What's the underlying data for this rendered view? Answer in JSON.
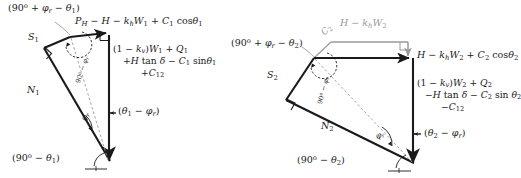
{
  "figure": {
    "type": "force-polygon-diagram",
    "colors": {
      "stroke": "#1a1a1a",
      "dashed": "#9a9a9a",
      "gray_construction": "#9a9a9a",
      "background": "#ffffff"
    }
  },
  "left_polygon": {
    "name": "polygon-1",
    "angle_top_left": "(90° + ϕr − θ1)",
    "top_force": "PH − H − khW1 + C1 cosθ1",
    "side_label_S": "S1",
    "side_label_N": "N1",
    "inner_angle": "90° − ϕr",
    "phi_label": "ϕr",
    "angle_mid_right": "(θ1 − ϕr)",
    "angle_bottom_left": "(90° − θ1)",
    "right_force_lines": [
      "(1 − kv)W1 + Q1",
      "+H tan δ − C1 sinθ1",
      "+C12"
    ]
  },
  "right_polygon": {
    "name": "polygon-2",
    "angle_top_left": "(90° + ϕr − θ2)",
    "gray_label_C": "C2",
    "gray_top_force": "H − khW2",
    "top_force": "H − khW2 + C2 cosθ2",
    "side_label_S": "S2",
    "side_label_N": "N2",
    "inner_angle": "90° − ϕr",
    "phi_label": "ϕr",
    "angle_mid_right": "(θ2 − ϕr)",
    "angle_bottom_left": "(90° − θ2)",
    "right_force_lines": [
      "(1 − kv)W2 + Q2",
      "−H tan δ − C2 sin θ2",
      "−C12"
    ]
  }
}
